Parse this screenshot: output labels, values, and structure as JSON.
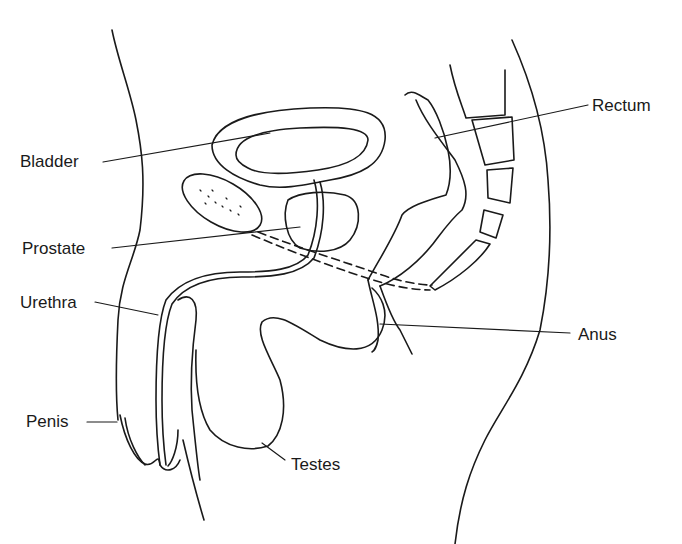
{
  "diagram": {
    "title": "",
    "labels": [
      {
        "id": "bladder",
        "text": "Bladder"
      },
      {
        "id": "prostate",
        "text": "Prostate"
      },
      {
        "id": "urethra",
        "text": "Urethra"
      },
      {
        "id": "penis",
        "text": "Penis"
      },
      {
        "id": "testes",
        "text": "Testes"
      },
      {
        "id": "rectum",
        "text": "Rectum"
      },
      {
        "id": "anus",
        "text": "Anus"
      }
    ],
    "colors": {
      "line": "#1a1a1a",
      "background": "#ffffff"
    }
  }
}
